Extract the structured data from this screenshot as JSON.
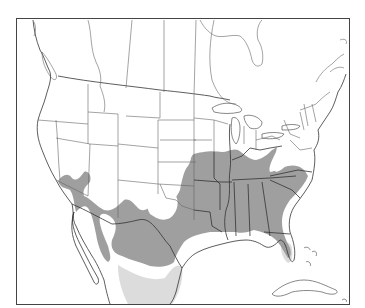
{
  "map": {
    "region": "North America (United States, southern Canada, northern Mexico, Caribbean)",
    "type": "species range map",
    "legend": [],
    "colors": {
      "background": "#ffffff",
      "outline": "#555555",
      "range_primary": "#9a9a9a",
      "range_secondary": "#dcdcdc"
    },
    "layers": [
      {
        "id": "range_primary",
        "description": "Dark gray shaded range covering southeastern and south-central US into northern Mexico and Arizona"
      },
      {
        "id": "range_secondary",
        "description": "Light gray shaded range in northeastern Mexico and southern Florida"
      }
    ]
  }
}
